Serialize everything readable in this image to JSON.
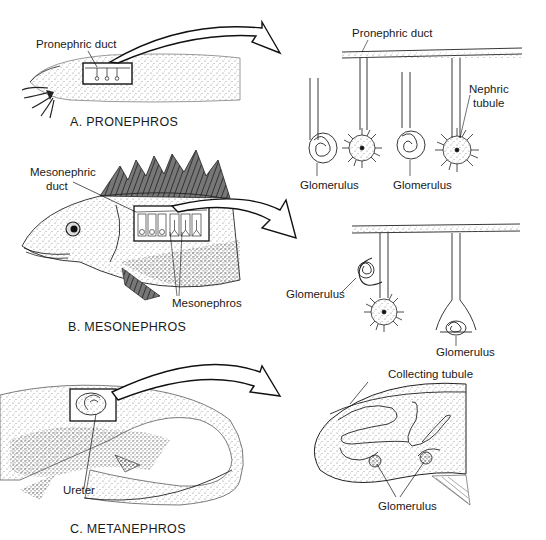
{
  "figure": {
    "panels": [
      {
        "id": "A",
        "caption": "A. PRONEPHROS",
        "organism": "larval amphibian",
        "left_labels": [
          "Pronephric duct"
        ],
        "detail_labels": [
          "Pronephric duct",
          "Nephric tubule",
          "Glomerulus",
          "Glomerulus"
        ]
      },
      {
        "id": "B",
        "caption": "B. MESONEPHROS",
        "organism": "fish",
        "left_labels": [
          "Mesonephric duct",
          "Mesonephros"
        ],
        "detail_labels": [
          "Glomerulus",
          "Glomerulus"
        ]
      },
      {
        "id": "C",
        "caption": "C. METANEPHROS",
        "organism": "reptile",
        "left_labels": [
          "Ureter"
        ],
        "detail_labels": [
          "Collecting tubule",
          "Glomerulus"
        ]
      }
    ]
  },
  "labels": {
    "a_pronephric_duct_left": "Pronephric duct",
    "a_caption": "A. PRONEPHROS",
    "a_pronephric_duct_right": "Pronephric duct",
    "a_nephric_tubule_1": "Nephric",
    "a_nephric_tubule_2": "tubule",
    "a_glomerulus_1": "Glomerulus",
    "a_glomerulus_2": "Glomerulus",
    "b_mesonephric_duct_1": "Mesonephric",
    "b_mesonephric_duct_2": "duct",
    "b_mesonephros": "Mesonephros",
    "b_caption": "B. MESONEPHROS",
    "b_glomerulus_1": "Glomerulus",
    "b_glomerulus_2": "Glomerulus",
    "c_ureter": "Ureter",
    "c_caption": "C. METANEPHROS",
    "c_collecting_tubule": "Collecting tubule",
    "c_glomerulus": "Glomerulus"
  },
  "colors": {
    "ink": "#1a1a1a",
    "stipple": "#9a9a9a",
    "background": "#ffffff"
  }
}
